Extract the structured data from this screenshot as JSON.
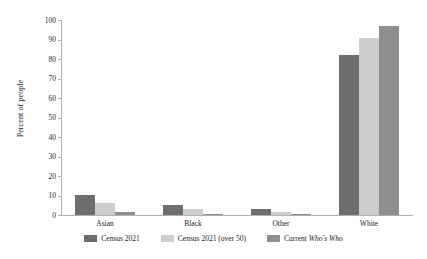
{
  "chart_data": {
    "type": "bar",
    "title": "",
    "subtitle": "",
    "xlabel": "",
    "ylabel": "Percent of people",
    "ylim": [
      0,
      100
    ],
    "ytick_step": 10,
    "yticks": [
      "0",
      "10",
      "20",
      "30",
      "40",
      "50",
      "60",
      "70",
      "80",
      "90",
      "100"
    ],
    "grid": false,
    "legend_position": "bottom",
    "categories": [
      "Asian",
      "Black",
      "Other",
      "White"
    ],
    "series": [
      {
        "name": "Census 2021",
        "color": "#6e6e6e",
        "values": [
          10.5,
          5.0,
          3.0,
          82.0
        ]
      },
      {
        "name": "Census 2021 (over 50)",
        "color": "#cdcdcd",
        "values": [
          6.0,
          3.0,
          1.5,
          91.0
        ]
      },
      {
        "name": "Current Who's Who",
        "color": "#8e8e8e",
        "values": [
          1.5,
          0.5,
          0.5,
          97.0
        ]
      }
    ],
    "legend": [
      {
        "label_plain": "Census 2021",
        "label_pre": "Census 2021",
        "label_italic": "",
        "label_post": "",
        "color": "#6e6e6e"
      },
      {
        "label_plain": "Census 2021 (over 50)",
        "label_pre": "Census 2021 (over 50)",
        "label_italic": "",
        "label_post": "",
        "color": "#cdcdcd"
      },
      {
        "label_plain": "Current Who's Who",
        "label_pre": "Current ",
        "label_italic": "Who's Who",
        "label_post": "",
        "color": "#8e8e8e"
      }
    ]
  }
}
